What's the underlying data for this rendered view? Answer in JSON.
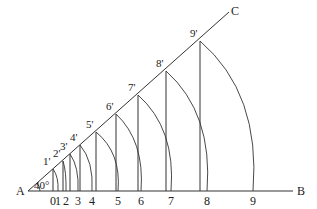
{
  "diagram": {
    "points": {
      "A": "A",
      "B": "B",
      "C": "C"
    },
    "angle_label": "40°",
    "base_labels": [
      "0",
      "1",
      "2",
      "3",
      "4",
      "5",
      "6",
      "7",
      "8",
      "9"
    ],
    "ray_labels": [
      "1'",
      "2'",
      "3'",
      "4'",
      "5'",
      "6'",
      "7'",
      "8'",
      "9'"
    ],
    "stroke_color": "#333333"
  }
}
